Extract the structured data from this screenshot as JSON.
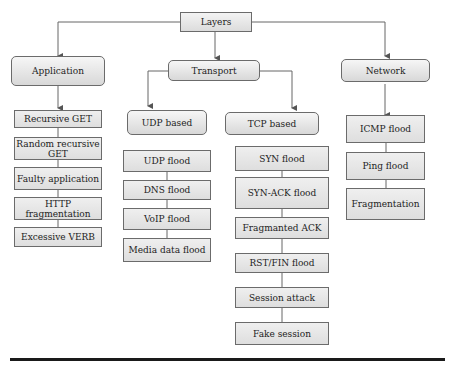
{
  "root": {
    "label": "Layers"
  },
  "categories": [
    {
      "label": "Application"
    },
    {
      "label": "Transport"
    },
    {
      "label": "Network"
    }
  ],
  "transport_subcategories": [
    {
      "label": "UDP based"
    },
    {
      "label": "TCP based"
    }
  ],
  "application_attacks": [
    "Recursive GET",
    "Random recursive GET",
    "Faulty application",
    "HTTP fragmentation",
    "Excessive VERB"
  ],
  "udp_attacks": [
    "UDP flood",
    "DNS flood",
    "VoIP flood",
    "Media data flood"
  ],
  "tcp_attacks": [
    "SYN flood",
    "SYN-ACK flood",
    "Fragmanted ACK",
    "RST/FIN flood",
    "Session attack",
    "Fake session"
  ],
  "network_attacks": [
    "ICMP flood",
    "Ping flood",
    "Fragmentation"
  ]
}
